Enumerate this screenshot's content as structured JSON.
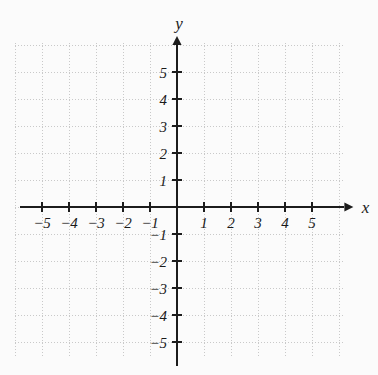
{
  "chart_data": {
    "type": "scatter",
    "title": "",
    "subtitle": "",
    "xlabel": "x",
    "ylabel": "y",
    "xlim": [
      -5.8,
      6.2
    ],
    "ylim": [
      -5.9,
      6.0
    ],
    "x_ticks": [
      -5,
      -4,
      -3,
      -2,
      -1,
      1,
      2,
      3,
      4,
      5
    ],
    "y_ticks": [
      5,
      4,
      3,
      2,
      1,
      -1,
      -2,
      -3,
      -4,
      -5
    ],
    "x_tick_labels": [
      "−5",
      "−4",
      "−3",
      "−2",
      "−1",
      "1",
      "2",
      "3",
      "4",
      "5"
    ],
    "y_tick_labels": [
      "5",
      "4",
      "3",
      "2",
      "1",
      "−1",
      "−2",
      "−3",
      "−4",
      "−5"
    ],
    "grid": true,
    "grid_style": "dotted",
    "grid_spacing_units": 1,
    "legend": false,
    "legend_position": "none",
    "series": [],
    "values": [],
    "annotations": [],
    "axis_arrows": [
      "x-positive",
      "y-positive"
    ],
    "origin_label": ""
  },
  "axes": {
    "x_label": "x",
    "y_label": "y"
  },
  "colors": {
    "background": "#fbfbfb",
    "grid": "#c9c9c9",
    "axis": "#1c1c1c",
    "tick_label": "#1a1a1a"
  },
  "geometry": {
    "origin_x": 177,
    "origin_y": 207,
    "unit_px": 27,
    "grid_left": 15,
    "grid_right": 345,
    "grid_top": 43,
    "grid_bottom": 358
  }
}
